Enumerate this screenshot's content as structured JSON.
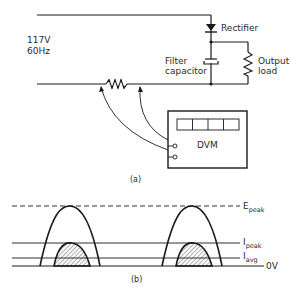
{
  "circuit": {
    "source_voltage": "117V",
    "source_frequency": "60Hz",
    "rectifier_label": "Rectifier",
    "filter_capacitor_label_line1": "Filter",
    "filter_capacitor_label_line2": "capacitor",
    "output_load_label_line1": "Output",
    "output_load_label_line2": "load",
    "meter_label": "DVM",
    "meter_display_segments": 4,
    "caption": "(a)"
  },
  "waveform": {
    "e_peak_main": "E",
    "e_peak_sub": "peak",
    "i_peak_main": "I",
    "i_peak_sub": "peak",
    "i_avg_main": "I",
    "i_avg_sub": "avg",
    "zero_label": "0V",
    "caption": "(b)"
  },
  "colors": {
    "ink": "#1a1a1a",
    "background": "#ffffff"
  }
}
